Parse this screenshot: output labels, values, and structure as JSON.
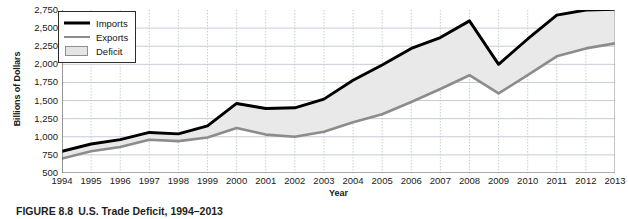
{
  "figure": {
    "caption_number": "FIGURE 8.8",
    "caption_title": "U.S. Trade Deficit, 1994–2013"
  },
  "chart_data": {
    "type": "area",
    "title": "U.S. Trade Deficit, 1994–2013",
    "xlabel": "Year",
    "ylabel": "Billions of Dollars",
    "categories": [
      1994,
      1995,
      1996,
      1997,
      1998,
      1999,
      2000,
      2001,
      2002,
      2003,
      2004,
      2005,
      2006,
      2007,
      2008,
      2009,
      2010,
      2011,
      2012,
      2013
    ],
    "x_tick_labels": [
      "1994",
      "1995",
      "1996",
      "1997",
      "1998",
      "1999",
      "2000",
      "2001",
      "2002",
      "2003",
      "2004",
      "2005",
      "2006",
      "2007",
      "2008",
      "2009",
      "2010",
      "2011",
      "2012",
      "2013"
    ],
    "y_tick_labels": [
      "2,750",
      "2,500",
      "2,250",
      "2,000",
      "1,750",
      "1,500",
      "1,250",
      "1,000",
      "750",
      "500"
    ],
    "y_tick_values": [
      2750,
      2500,
      2250,
      2000,
      1750,
      1500,
      1250,
      1000,
      750,
      500
    ],
    "ylim": [
      500,
      2750
    ],
    "grid": true,
    "legend_position": "top-left",
    "series": [
      {
        "name": "Imports",
        "color": "#000000",
        "values": [
          800,
          900,
          960,
          1060,
          1040,
          1150,
          1460,
          1390,
          1400,
          1520,
          1780,
          1990,
          2220,
          2370,
          2600,
          2000,
          2350,
          2680,
          2750,
          2760
        ]
      },
      {
        "name": "Exports",
        "color": "#8c8c8c",
        "values": [
          700,
          800,
          860,
          960,
          940,
          990,
          1120,
          1030,
          1000,
          1070,
          1200,
          1310,
          1480,
          1660,
          1850,
          1600,
          1850,
          2110,
          2220,
          2290
        ]
      }
    ],
    "fill": {
      "name": "Deficit",
      "between": [
        "Imports",
        "Exports"
      ],
      "color": "#e9e9e9"
    }
  },
  "legend": {
    "items": [
      {
        "label": "Imports",
        "key": "black-line",
        "color": "#000000"
      },
      {
        "label": "Exports",
        "key": "gray-line",
        "color": "#8c8c8c"
      },
      {
        "label": "Deficit",
        "key": "gray-swatch",
        "color": "#e4e4e4"
      }
    ]
  }
}
